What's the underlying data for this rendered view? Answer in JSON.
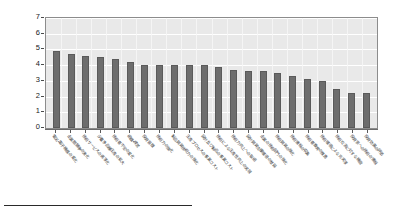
{
  "chart_data": {
    "type": "bar",
    "title": "",
    "subtitle": "",
    "xlabel": "",
    "ylabel": "",
    "ylim": [
      0,
      7
    ],
    "ytick_labels": [
      "7",
      "6",
      "5",
      "4",
      "3",
      "2",
      "1",
      "0"
    ],
    "ytick_values": [
      7,
      6,
      5,
      4,
      3,
      2,
      1,
      0
    ],
    "grid": true,
    "legend": false,
    "legend_position": "none",
    "bar_color": "#6d6d6d",
    "plot_background": "#e9e9e9",
    "categories": [
      "電気・電子機器の変化",
      "企業間競争の激化",
      "技術サービスの高度化",
      "少量多品種生産の拡大",
      "技術者不足の変化",
      "組織・経営",
      "投資意識",
      "技術力の強化",
      "製品開発技術力の強化",
      "生産プロセスの事業コスト",
      "設計及び製品の事業コスト",
      "技術による生産性向上の実現",
      "技術力向上への取組",
      "設計開発支援環境の整備",
      "企業の技術部門の強化",
      "技術開発の強化",
      "技術情報の収集",
      "技術者教育の推進",
      "技術環境による充実度",
      "技術交流に対する機能",
      "投資家への技術の情報",
      "投資効果の評価"
    ],
    "values": [
      4.9,
      4.7,
      4.6,
      4.5,
      4.4,
      4.2,
      4.0,
      4.0,
      4.0,
      4.0,
      4.0,
      3.9,
      3.7,
      3.6,
      3.6,
      3.5,
      3.3,
      3.1,
      3.0,
      2.5,
      2.2,
      2.2
    ]
  }
}
